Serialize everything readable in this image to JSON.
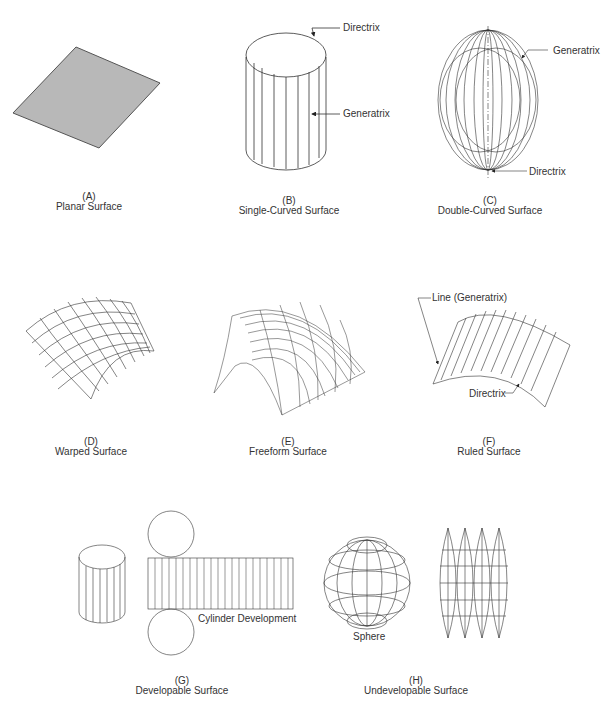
{
  "figures": [
    {
      "id": "A",
      "letter": "(A)",
      "caption": "Planar Surface"
    },
    {
      "id": "B",
      "letter": "(B)",
      "caption": "Single-Curved Surface",
      "callouts": [
        "Directrix",
        "Generatrix"
      ]
    },
    {
      "id": "C",
      "letter": "(C)",
      "caption": "Double-Curved Surface",
      "callouts": [
        "Generatrix",
        "Directrix"
      ]
    },
    {
      "id": "D",
      "letter": "(D)",
      "caption": "Warped Surface"
    },
    {
      "id": "E",
      "letter": "(E)",
      "caption": "Freeform Surface"
    },
    {
      "id": "F",
      "letter": "(F)",
      "caption": "Ruled Surface",
      "callouts": [
        "Line (Generatrix)",
        "Directrix"
      ]
    },
    {
      "id": "G",
      "letter": "(G)",
      "caption": "Developable Surface",
      "callouts": [
        "Cylinder Development"
      ]
    },
    {
      "id": "H",
      "letter": "(H)",
      "caption": "Undevelopable Surface",
      "callouts": [
        "Sphere"
      ]
    }
  ],
  "colors": {
    "line": "#333333",
    "plane_fill": "#b8b8b8",
    "background": "#ffffff"
  }
}
